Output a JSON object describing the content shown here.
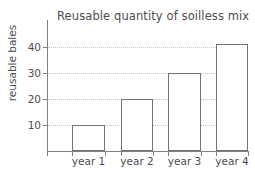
{
  "chart_data": {
    "type": "bar",
    "title": "Reusable quantity of soilless mix",
    "xlabel": "",
    "ylabel": "reusable bales",
    "categories": [
      "year 1",
      "year 2",
      "year 3",
      "year 4"
    ],
    "values": [
      10,
      20,
      30,
      41
    ],
    "ylim": [
      0,
      50
    ],
    "yticks": [
      10,
      20,
      30,
      40
    ],
    "ytick_labels": [
      "10",
      "20",
      "30",
      "40"
    ],
    "grid": true,
    "grid_axis": "y",
    "grid_style": "dotted",
    "legend": false,
    "legend_position": "none",
    "bar_fill_color": "#ffffff",
    "bar_edge_color": "#737373",
    "axis_color": "#808080",
    "grid_color": "#c8c8c8",
    "text_color": "#4d4d4d",
    "background_color": "#ffffff"
  }
}
